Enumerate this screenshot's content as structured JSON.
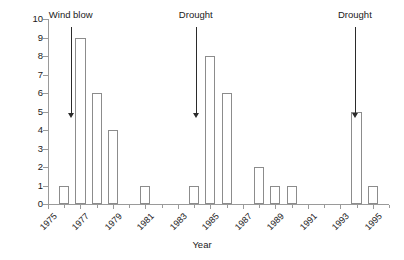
{
  "chart_data": {
    "type": "bar",
    "title": "",
    "subtitle": "",
    "xlabel": "Year",
    "ylabel": "Volume killed (thousands)",
    "xlim": [
      1975,
      1996
    ],
    "ylim": [
      0,
      10
    ],
    "grid": false,
    "legend": "none",
    "bar_style": {
      "fill": "#ffffff",
      "edge": "#8c8c8c",
      "width_years": 0.62
    },
    "axis_color": "#9a9a9a",
    "text_color": "#1a1a1a",
    "ytick_labels": [
      "0",
      "1",
      "2",
      "3",
      "4",
      "5",
      "6",
      "7",
      "8",
      "9",
      "10"
    ],
    "ytick_values": [
      0,
      1,
      2,
      3,
      4,
      5,
      6,
      7,
      8,
      9,
      10
    ],
    "xtick_labels": [
      "1975",
      "1977",
      "1979",
      "1981",
      "1983",
      "1985",
      "1987",
      "1989",
      "1991",
      "1993",
      "1995"
    ],
    "xtick_values": [
      1975,
      1977,
      1979,
      1981,
      1983,
      1985,
      1987,
      1989,
      1991,
      1993,
      1995
    ],
    "xtick_minor_values": [
      1976,
      1978,
      1980,
      1982,
      1984,
      1986,
      1988,
      1990,
      1992,
      1994,
      1996
    ],
    "categories": [
      1975,
      1976,
      1977,
      1978,
      1979,
      1980,
      1981,
      1982,
      1983,
      1984,
      1985,
      1986,
      1987,
      1988,
      1989,
      1990,
      1991,
      1992,
      1993,
      1994,
      1995
    ],
    "values": [
      0,
      1,
      9,
      6,
      4,
      0,
      1,
      0,
      0,
      1,
      8,
      6,
      0,
      2,
      1,
      1,
      0,
      0,
      0,
      5,
      1
    ],
    "annotations": [
      {
        "text": "Wind blow",
        "x": 1976.4,
        "label_y": 10.25,
        "arrow_from_y": 9.55,
        "arrow_to_y": 4.9
      },
      {
        "text": "Drought",
        "x": 1984.1,
        "label_y": 10.25,
        "arrow_from_y": 9.55,
        "arrow_to_y": 4.9
      },
      {
        "text": "Drought",
        "x": 1993.9,
        "label_y": 10.25,
        "arrow_from_y": 9.55,
        "arrow_to_y": 4.9
      }
    ]
  }
}
